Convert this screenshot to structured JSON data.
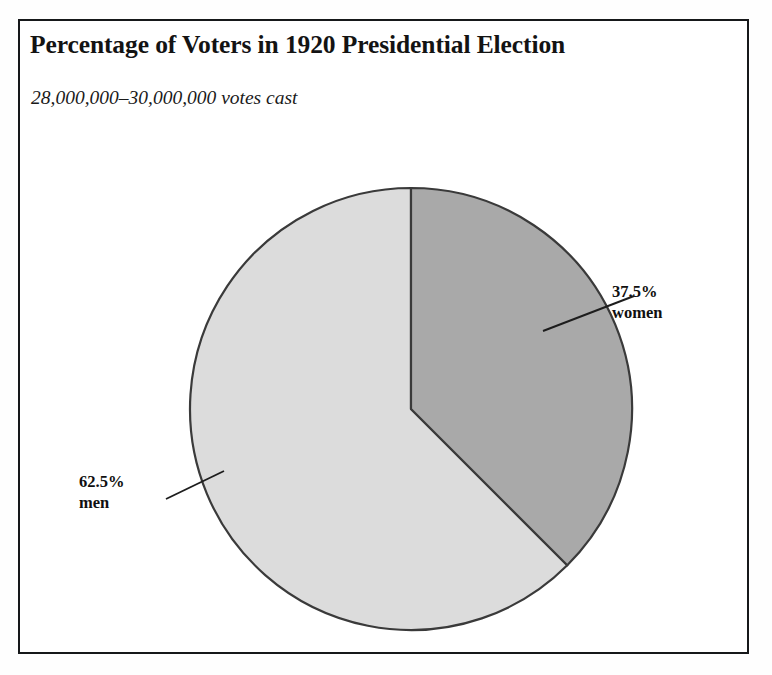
{
  "figure": {
    "title": "Percentage of Voters in 1920 Presidential Election",
    "subtitle": "28,000,000–30,000,000 votes cast"
  },
  "labels": {
    "women": {
      "percent": "37.5%",
      "name": "women"
    },
    "men": {
      "percent": "62.5%",
      "name": "men"
    }
  },
  "colors": {
    "women_slice": "#a9a9a9",
    "men_slice": "#dcdcdc",
    "outline": "#3a3a3a",
    "frame": "#16181a",
    "text": "#111111",
    "background": "#ffffff"
  },
  "chart_data": {
    "type": "pie",
    "title": "Percentage of Voters in 1920 Presidential Election",
    "subtitle": "28,000,000–30,000,000 votes cast",
    "categories": [
      "women",
      "men"
    ],
    "values": [
      37.5,
      62.5
    ],
    "value_labels": [
      "37.5%",
      "62.5%"
    ],
    "units": "percent",
    "total": 100,
    "start_angle_deg": 0,
    "direction": "clockwise",
    "slice_colors": [
      "#a9a9a9",
      "#dcdcdc"
    ],
    "legend": "none",
    "labels_position": "external with leader lines",
    "grid": false,
    "annotations": [
      "37.5% women",
      "62.5% men"
    ]
  }
}
